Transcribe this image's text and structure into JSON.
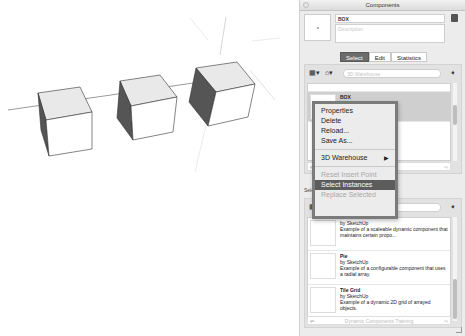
{
  "viewport": {
    "cubes": 3
  },
  "panel": {
    "title": "Components",
    "component_name": "BOX",
    "description_placeholder": "Description",
    "tabs": [
      {
        "label": "Select",
        "active": true
      },
      {
        "label": "Edit",
        "active": false
      },
      {
        "label": "Statistics",
        "active": false
      }
    ],
    "top_browser": {
      "search_placeholder": "3D Warehouse",
      "items": [
        {
          "name": "",
          "author": "",
          "desc": ""
        },
        {
          "name": "BOX",
          "author": "by Unknown",
          "desc": "",
          "selected": true
        }
      ]
    },
    "secondary_label": "Select",
    "bottom_browser": {
      "search_placeholder": "3D Warehouse",
      "items": [
        {
          "name": "",
          "author": "by SketchUp",
          "desc": "Example of a scaleable dynamic component that maintains certain propo..."
        },
        {
          "name": "Pie",
          "author": "by SketchUp",
          "desc": "Example of a configurable component that uses a radial array."
        },
        {
          "name": "Tile Grid",
          "author": "by SketchUp",
          "desc": "Example of a dynamic 2D grid of arrayed objects."
        }
      ],
      "footer": "Dynamic Components Training"
    }
  },
  "context_menu": {
    "items": [
      {
        "label": "Properties",
        "state": "normal"
      },
      {
        "label": "Delete",
        "state": "normal"
      },
      {
        "label": "Reload...",
        "state": "normal"
      },
      {
        "label": "Save As...",
        "state": "normal"
      },
      {
        "label": "3D Warehouse",
        "state": "submenu",
        "arrow": "▶"
      },
      {
        "label": "Reset Insert Point",
        "state": "disabled"
      },
      {
        "label": "Select Instances",
        "state": "highlighted"
      },
      {
        "label": "Replace Selected",
        "state": "disabled"
      }
    ]
  }
}
